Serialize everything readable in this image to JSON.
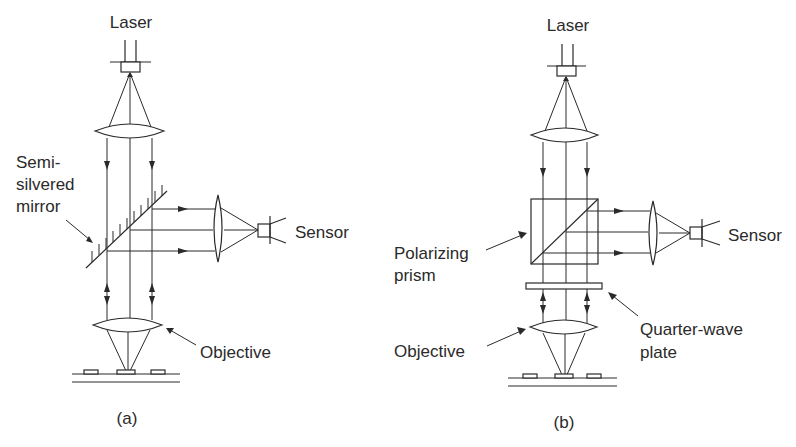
{
  "figure": {
    "type": "optical-schematic"
  },
  "panels": [
    {
      "id": "a",
      "caption": "(a)",
      "labels": {
        "laser": "Laser",
        "splitter_line1": "Semi-",
        "splitter_line2": "silvered",
        "splitter_line3": "mirror",
        "sensor": "Sensor",
        "objective": "Objective"
      },
      "components": [
        "laser",
        "collimating-lens",
        "semi-silvered-mirror",
        "sensor-lens",
        "sensor",
        "objective-lens",
        "disc-surface"
      ]
    },
    {
      "id": "b",
      "caption": "(b)",
      "labels": {
        "laser": "Laser",
        "splitter_line1": "Polarizing",
        "splitter_line2": "prism",
        "sensor": "Sensor",
        "objective": "Objective",
        "plate_line1": "Quarter-wave",
        "plate_line2": "plate"
      },
      "components": [
        "laser",
        "collimating-lens",
        "polarizing-prism",
        "sensor-lens",
        "sensor",
        "quarter-wave-plate",
        "objective-lens",
        "disc-surface"
      ]
    }
  ],
  "colors": {
    "ink": "#2a2a2a",
    "background": "#ffffff"
  }
}
